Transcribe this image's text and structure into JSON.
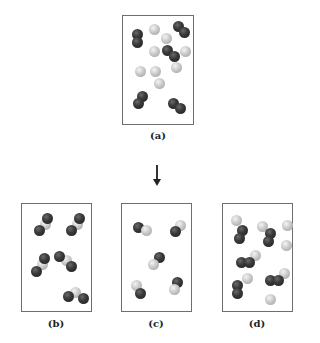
{
  "diagram": {
    "type": "chemical-reaction-particle-diagram",
    "colors": {
      "dark_atom": "#2a2a2a",
      "light_atom": "#c4c4c4",
      "box_border": "#6e6e6e",
      "arrow": "#222222"
    },
    "panels": [
      {
        "id": "a",
        "label": "(a)",
        "role": "reactants",
        "box": {
          "left": 122,
          "top": 15,
          "width": 72,
          "height": 110
        },
        "label_pos": {
          "left": 138,
          "top": 130
        },
        "atoms": [
          {
            "type": "dark",
            "x": 9,
            "y": 13
          },
          {
            "type": "dark",
            "x": 9,
            "y": 21
          },
          {
            "type": "dark",
            "x": 50,
            "y": 5
          },
          {
            "type": "dark",
            "x": 56,
            "y": 11
          },
          {
            "type": "dark",
            "x": 39,
            "y": 29
          },
          {
            "type": "dark",
            "x": 46,
            "y": 35
          },
          {
            "type": "dark",
            "x": 14,
            "y": 75
          },
          {
            "type": "dark",
            "x": 10,
            "y": 82
          },
          {
            "type": "dark",
            "x": 45,
            "y": 82
          },
          {
            "type": "dark",
            "x": 52,
            "y": 87
          },
          {
            "type": "light",
            "x": 26,
            "y": 8
          },
          {
            "type": "light",
            "x": 38,
            "y": 17
          },
          {
            "type": "light",
            "x": 26,
            "y": 30
          },
          {
            "type": "light",
            "x": 57,
            "y": 30
          },
          {
            "type": "light",
            "x": 12,
            "y": 50
          },
          {
            "type": "light",
            "x": 27,
            "y": 50
          },
          {
            "type": "light",
            "x": 48,
            "y": 46
          },
          {
            "type": "light",
            "x": 31,
            "y": 62
          }
        ]
      },
      {
        "id": "b",
        "label": "(b)",
        "role": "possible-product",
        "box": {
          "left": 21,
          "top": 203,
          "width": 71,
          "height": 109
        },
        "label_pos": {
          "left": 36,
          "top": 318
        },
        "atoms": [
          {
            "type": "light",
            "x": 18,
            "y": 15
          },
          {
            "type": "dark",
            "x": 20,
            "y": 9
          },
          {
            "type": "dark",
            "x": 12,
            "y": 21
          },
          {
            "type": "light",
            "x": 50,
            "y": 15
          },
          {
            "type": "dark",
            "x": 52,
            "y": 9
          },
          {
            "type": "dark",
            "x": 44,
            "y": 21
          },
          {
            "type": "light",
            "x": 15,
            "y": 55
          },
          {
            "type": "dark",
            "x": 17,
            "y": 49
          },
          {
            "type": "dark",
            "x": 9,
            "y": 62
          },
          {
            "type": "light",
            "x": 39,
            "y": 51
          },
          {
            "type": "dark",
            "x": 32,
            "y": 47
          },
          {
            "type": "dark",
            "x": 44,
            "y": 57
          },
          {
            "type": "light",
            "x": 48,
            "y": 83
          },
          {
            "type": "dark",
            "x": 41,
            "y": 87
          },
          {
            "type": "dark",
            "x": 56,
            "y": 89
          }
        ]
      },
      {
        "id": "c",
        "label": "(c)",
        "role": "possible-product",
        "box": {
          "left": 121,
          "top": 203,
          "width": 71,
          "height": 109
        },
        "label_pos": {
          "left": 136,
          "top": 318
        },
        "atoms": [
          {
            "type": "dark",
            "x": 11,
            "y": 18
          },
          {
            "type": "light",
            "x": 19,
            "y": 21
          },
          {
            "type": "light",
            "x": 53,
            "y": 16
          },
          {
            "type": "dark",
            "x": 48,
            "y": 22
          },
          {
            "type": "dark",
            "x": 32,
            "y": 48
          },
          {
            "type": "light",
            "x": 26,
            "y": 55
          },
          {
            "type": "light",
            "x": 9,
            "y": 76
          },
          {
            "type": "dark",
            "x": 13,
            "y": 84
          },
          {
            "type": "dark",
            "x": 50,
            "y": 73
          },
          {
            "type": "light",
            "x": 47,
            "y": 80
          }
        ]
      },
      {
        "id": "d",
        "label": "(d)",
        "role": "possible-product",
        "box": {
          "left": 222,
          "top": 203,
          "width": 71,
          "height": 109
        },
        "label_pos": {
          "left": 237,
          "top": 318
        },
        "atoms": [
          {
            "type": "light",
            "x": 8,
            "y": 11
          },
          {
            "type": "dark",
            "x": 14,
            "y": 21
          },
          {
            "type": "dark",
            "x": 11,
            "y": 29
          },
          {
            "type": "light",
            "x": 34,
            "y": 17
          },
          {
            "type": "dark",
            "x": 42,
            "y": 24
          },
          {
            "type": "dark",
            "x": 40,
            "y": 32
          },
          {
            "type": "light",
            "x": 59,
            "y": 16
          },
          {
            "type": "light",
            "x": 58,
            "y": 36
          },
          {
            "type": "light",
            "x": 27,
            "y": 46
          },
          {
            "type": "dark",
            "x": 13,
            "y": 53
          },
          {
            "type": "dark",
            "x": 21,
            "y": 53
          },
          {
            "type": "light",
            "x": 19,
            "y": 69
          },
          {
            "type": "dark",
            "x": 9,
            "y": 76
          },
          {
            "type": "dark",
            "x": 9,
            "y": 84
          },
          {
            "type": "light",
            "x": 56,
            "y": 64
          },
          {
            "type": "dark",
            "x": 42,
            "y": 71
          },
          {
            "type": "dark",
            "x": 50,
            "y": 71
          },
          {
            "type": "light",
            "x": 42,
            "y": 90
          }
        ]
      }
    ],
    "arrow": {
      "direction": "down",
      "from": {
        "x": 157,
        "y": 165
      },
      "to": {
        "x": 157,
        "y": 186
      }
    }
  }
}
